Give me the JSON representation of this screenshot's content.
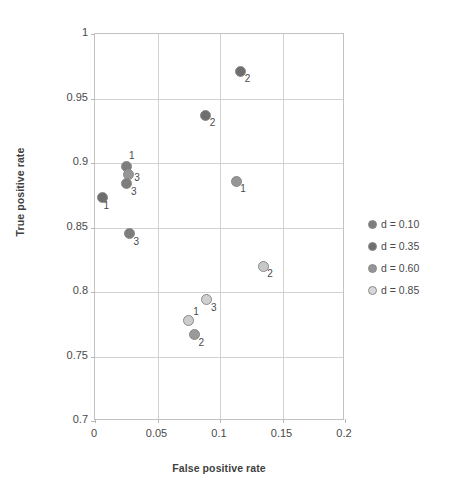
{
  "chart_data": {
    "type": "scatter",
    "title": "",
    "xlabel": "False positive rate",
    "ylabel": "True positive rate",
    "xlim": [
      0,
      0.2
    ],
    "ylim": [
      0.7,
      1
    ],
    "xticks": [
      "0",
      "0.05",
      "0.1",
      "0.15",
      "0.2"
    ],
    "xtick_values": [
      0,
      0.05,
      0.1,
      0.15,
      0.2
    ],
    "yticks": [
      "0.7",
      "0.75",
      "0.8",
      "0.85",
      "0.9",
      "0.95",
      "1"
    ],
    "ytick_values": [
      0.7,
      0.75,
      0.8,
      0.85,
      0.9,
      0.95,
      1
    ],
    "grid": true,
    "legend_position": "right",
    "series": [
      {
        "name": "d = 0.10",
        "color": "#7d7d7d",
        "points": [
          {
            "x": 0.006,
            "y": 0.873,
            "label": "1",
            "label_pos": "below-left"
          },
          {
            "x": 0.0255,
            "y": 0.897,
            "label": "1",
            "label_pos": "above"
          },
          {
            "x": 0.113,
            "y": 0.886,
            "label": "1",
            "label_pos": "below-right"
          },
          {
            "x": 0.0745,
            "y": 0.778,
            "label": "1",
            "label_pos": "above-right"
          }
        ]
      },
      {
        "name": "d = 0.35",
        "color": "#6e6e6e",
        "points": [
          {
            "x": 0.1165,
            "y": 0.971,
            "label": "2",
            "label_pos": "below-right"
          },
          {
            "x": 0.0885,
            "y": 0.937,
            "label": "2",
            "label_pos": "below-right"
          },
          {
            "x": 0.1345,
            "y": 0.82,
            "label": "2",
            "label_pos": "below-right"
          },
          {
            "x": 0.0795,
            "y": 0.767,
            "label": "2",
            "label_pos": "below-right"
          }
        ]
      },
      {
        "name": "d = 0.60",
        "color": "#969696",
        "points": [
          {
            "x": 0.0265,
            "y": 0.891,
            "label": "3",
            "label_pos": "right"
          },
          {
            "x": 0.0255,
            "y": 0.884,
            "label": "3",
            "label_pos": "below-right"
          },
          {
            "x": 0.0275,
            "y": 0.845,
            "label": "3",
            "label_pos": "below-right"
          },
          {
            "x": 0.0895,
            "y": 0.794,
            "label": "3",
            "label_pos": "below-right"
          }
        ]
      },
      {
        "name": "d = 0.85",
        "color": "#d8d8d8",
        "points": []
      }
    ],
    "legend_entries": [
      {
        "label": "d = 0.10",
        "color": "#7d7d7d"
      },
      {
        "label": "d = 0.35",
        "color": "#6e6e6e"
      },
      {
        "label": "d = 0.60",
        "color": "#969696"
      },
      {
        "label": "d = 0.85",
        "color": "#d8d8d8"
      }
    ],
    "all_points": [
      {
        "x": 0.1165,
        "y": 0.971,
        "label": "2",
        "color": "#6e6e6e",
        "series": "d = 0.35"
      },
      {
        "x": 0.0885,
        "y": 0.937,
        "label": "2",
        "color": "#6e6e6e",
        "series": "d = 0.35"
      },
      {
        "x": 0.0255,
        "y": 0.897,
        "label": "1",
        "color": "#7d7d7d",
        "series": "d = 0.10"
      },
      {
        "x": 0.0265,
        "y": 0.891,
        "label": "3",
        "color": "#969696",
        "series": "d = 0.60"
      },
      {
        "x": 0.0255,
        "y": 0.884,
        "label": "3",
        "color": "#7d7d7d",
        "series": "d = 0.60"
      },
      {
        "x": 0.113,
        "y": 0.886,
        "label": "1",
        "color": "#969696",
        "series": "d = 0.10"
      },
      {
        "x": 0.006,
        "y": 0.873,
        "label": "1",
        "color": "#6e6e6e",
        "series": "d = 0.10"
      },
      {
        "x": 0.0275,
        "y": 0.845,
        "label": "3",
        "color": "#7d7d7d",
        "series": "d = 0.60"
      },
      {
        "x": 0.1345,
        "y": 0.82,
        "label": "2",
        "color": "#c8c8c8",
        "series": "d = 0.85"
      },
      {
        "x": 0.0895,
        "y": 0.794,
        "label": "3",
        "color": "#d0d0d0",
        "series": "d = 0.85"
      },
      {
        "x": 0.0745,
        "y": 0.778,
        "label": "1",
        "color": "#cccccc",
        "series": "d = 0.85"
      },
      {
        "x": 0.0795,
        "y": 0.767,
        "label": "2",
        "color": "#9a9a9a",
        "series": "d = 0.35"
      }
    ]
  },
  "axes": {
    "x_title": "False positive rate",
    "y_title": "True positive rate"
  }
}
